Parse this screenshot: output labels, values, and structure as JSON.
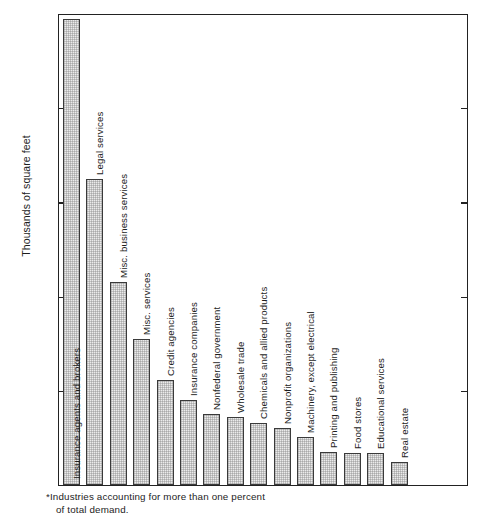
{
  "chart_data": {
    "type": "bar",
    "title": "",
    "xlabel": "",
    "ylabel": "Thousands of square feet",
    "ylim": [
      0,
      1000
    ],
    "yticks": [
      0,
      200,
      400,
      600,
      800,
      1000
    ],
    "ytick_labels": [
      "0",
      "200",
      "400",
      "600",
      "800",
      "1000"
    ],
    "grid": false,
    "legend": "none",
    "orientation": "vertical",
    "bar_label_rotation": "vertical",
    "categories": [
      "Insurance agents and brokers",
      "Legal services",
      "Misc. business services",
      "Misc. services",
      "Credit agencies",
      "Insurance companies",
      "Nonfederal government",
      "Wholesale trade",
      "Chemicals and allied products",
      "Nonprofit organizations",
      "Machinery, except electrical",
      "Printing and publishing",
      "Food stores",
      "Educational services",
      "Real estate"
    ],
    "values": [
      990,
      650,
      430,
      310,
      222,
      180,
      150,
      145,
      132,
      122,
      102,
      70,
      67,
      67,
      48
    ],
    "annotations": {
      "footnote_line1": "*Industries accounting for more than one percent",
      "footnote_line2": "of total demand."
    }
  },
  "bars": [
    {
      "label": "Insurance agents and brokers",
      "value": 990
    },
    {
      "label": "Legal services",
      "value": 650
    },
    {
      "label": "Misc. business services",
      "value": 430
    },
    {
      "label": "Misc. services",
      "value": 310
    },
    {
      "label": "Credit agencies",
      "value": 222
    },
    {
      "label": "Insurance companies",
      "value": 180
    },
    {
      "label": "Nonfederal government",
      "value": 150
    },
    {
      "label": "Wholesale trade",
      "value": 145
    },
    {
      "label": "Chemicals and allied products",
      "value": 132
    },
    {
      "label": "Nonprofit organizations",
      "value": 122
    },
    {
      "label": "Machinery, except electrical",
      "value": 102
    },
    {
      "label": "Printing and publishing",
      "value": 70
    },
    {
      "label": "Food stores",
      "value": 67
    },
    {
      "label": "Educational services",
      "value": 67
    },
    {
      "label": "Real estate",
      "value": 48
    }
  ],
  "axis": {
    "y_title": "Thousands of square feet",
    "y_ticks": [
      "1000",
      "800",
      "600",
      "400",
      "200",
      "0"
    ]
  },
  "footnote": {
    "line1": "*Industries accounting for more than one percent",
    "line2": "of total demand."
  },
  "colors": {
    "bar_fill": "#ebebeb",
    "bar_stroke": "#3a3a3a",
    "axis": "#222222",
    "text": "#1d1d1d",
    "background": "#ffffff"
  }
}
